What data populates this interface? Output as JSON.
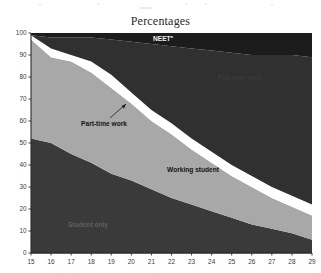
{
  "figure": {
    "title": "Percentages",
    "axis": {
      "y_ticks": [
        "100",
        "90",
        "80",
        "70",
        "60",
        "50",
        "40",
        "30",
        "20",
        "10",
        "0"
      ],
      "x_ticks": [
        "15",
        "16",
        "17",
        "18",
        "19",
        "20",
        "21",
        "22",
        "23",
        "24",
        "25",
        "26",
        "27",
        "28",
        "29"
      ]
    },
    "labels": {
      "neet": "NEET",
      "neet_footnote": "a",
      "full_time": "Full-time work",
      "part_time": "Part-time work",
      "working_student": "Working student",
      "student_only": "Student only"
    }
  },
  "chart_data": {
    "type": "area",
    "title": "Percentages",
    "xlabel": "",
    "ylabel": "Percentages",
    "xlim": [
      15,
      29
    ],
    "ylim": [
      0,
      100
    ],
    "grid": false,
    "legend": "inline-annotations",
    "stacked": true,
    "x": [
      15,
      16,
      17,
      18,
      19,
      20,
      21,
      22,
      23,
      24,
      25,
      26,
      27,
      28,
      29
    ],
    "categories": [
      "15",
      "16",
      "17",
      "18",
      "19",
      "20",
      "21",
      "22",
      "23",
      "24",
      "25",
      "26",
      "27",
      "28",
      "29"
    ],
    "series": [
      {
        "name": "Student only",
        "color": "#3a3a3a",
        "values": [
          52,
          50,
          45,
          41,
          36,
          33,
          29,
          25,
          22,
          19,
          16,
          13,
          11,
          9,
          6
        ]
      },
      {
        "name": "Working student",
        "color": "#a8a8a8",
        "values": [
          45,
          39,
          42,
          41,
          39,
          35,
          31,
          29,
          25,
          22,
          19,
          17,
          14,
          12,
          11
        ]
      },
      {
        "name": "Part-time work",
        "color": "#ffffff",
        "values": [
          2,
          4,
          3,
          5,
          6,
          5,
          5,
          5,
          5,
          5,
          5,
          5,
          5,
          5,
          5
        ]
      },
      {
        "name": "Full-time work",
        "color": "#303030",
        "values": [
          0,
          5,
          8,
          11,
          16,
          23,
          30,
          35,
          41,
          46,
          51,
          55,
          60,
          64,
          67
        ]
      },
      {
        "name": "NEET",
        "color": "#1c1c1c",
        "values": [
          1,
          2,
          2,
          2,
          3,
          4,
          5,
          6,
          7,
          8,
          9,
          10,
          10,
          10,
          11
        ]
      }
    ],
    "cumulative_tops": {
      "Student only": [
        52,
        50,
        45,
        41,
        36,
        33,
        29,
        25,
        22,
        19,
        16,
        13,
        11,
        9,
        6
      ],
      "Working student": [
        97,
        89,
        87,
        82,
        75,
        68,
        60,
        54,
        47,
        41,
        35,
        30,
        25,
        21,
        17
      ],
      "Part-time work": [
        99,
        93,
        90,
        87,
        81,
        73,
        65,
        59,
        52,
        46,
        40,
        35,
        30,
        26,
        22
      ],
      "Full-time work": [
        99,
        98,
        98,
        98,
        97,
        96,
        95,
        94,
        93,
        92,
        91,
        90,
        90,
        90,
        89
      ],
      "NEET": [
        100,
        100,
        100,
        100,
        100,
        100,
        100,
        100,
        100,
        100,
        100,
        100,
        100,
        100,
        100
      ]
    },
    "colors": {
      "student_only": "#3a3a3a",
      "working_student": "#a8a8a8",
      "part_time_work": "#ffffff",
      "full_time_work": "#303030",
      "neet": "#1c1c1c",
      "background": "#ffffff",
      "axis": "#2b2b2b"
    }
  }
}
